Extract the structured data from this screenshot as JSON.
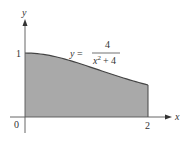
{
  "chart_data": {
    "type": "area",
    "title": "",
    "equation": {
      "lhs": "y =",
      "numerator": "4",
      "denominator_base": "x",
      "denominator_exp": "2",
      "denominator_rest": "+ 4"
    },
    "xlabel": "x",
    "ylabel": "y",
    "x_ticks": [
      "0",
      "2"
    ],
    "y_ticks": [
      "1"
    ],
    "xlim": [
      0,
      2
    ],
    "ylim": [
      0,
      1
    ],
    "x": [
      0,
      0.25,
      0.5,
      0.75,
      1.0,
      1.25,
      1.5,
      1.75,
      2.0
    ],
    "values": [
      1.0,
      0.985,
      0.941,
      0.877,
      0.8,
      0.719,
      0.64,
      0.566,
      0.5
    ],
    "shaded_region": "area under y = 4/(x^2+4) from x=0 to x=2",
    "fill_color": "#a9a9a9",
    "line_color": "#444444"
  }
}
